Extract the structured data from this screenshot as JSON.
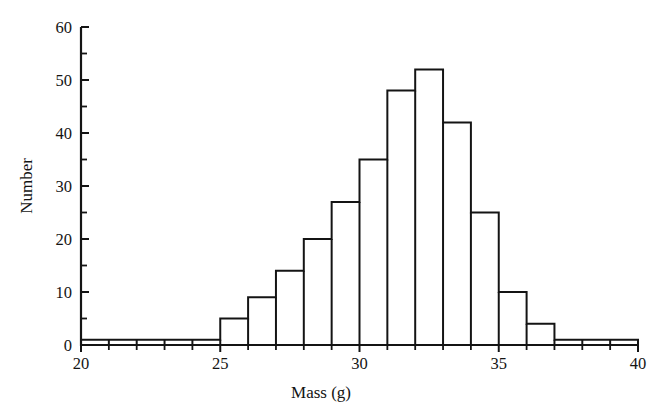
{
  "chart_data": {
    "type": "bar",
    "title": "",
    "subtitle": "",
    "xlabel": "Mass (g)",
    "ylabel": "Number",
    "xlim": [
      20,
      40
    ],
    "ylim": [
      0,
      60
    ],
    "grid": false,
    "legend": null,
    "bin_width": 1,
    "bin_edges": [
      20,
      21,
      22,
      23,
      24,
      25,
      26,
      27,
      28,
      29,
      30,
      31,
      32,
      33,
      34,
      35,
      36,
      37,
      38,
      39,
      40
    ],
    "categories": [
      "20-21",
      "21-22",
      "22-23",
      "23-24",
      "24-25",
      "25-26",
      "26-27",
      "27-28",
      "28-29",
      "29-30",
      "30-31",
      "31-32",
      "32-33",
      "33-34",
      "34-35",
      "35-36",
      "36-37",
      "37-38",
      "38-39",
      "39-40"
    ],
    "values": [
      1,
      1,
      1,
      1,
      1,
      5,
      9,
      14,
      20,
      27,
      35,
      48,
      52,
      42,
      25,
      10,
      4,
      1,
      1,
      1
    ],
    "x_ticks_major": [
      20,
      25,
      30,
      35,
      40
    ],
    "x_tick_labels": [
      "20",
      "25",
      "30",
      "35",
      "40"
    ],
    "x_ticks_minor": [
      21,
      22,
      23,
      24,
      26,
      27,
      28,
      29,
      31,
      32,
      33,
      34,
      36,
      37,
      38,
      39
    ],
    "y_ticks_major": [
      0,
      10,
      20,
      30,
      40,
      50,
      60
    ],
    "y_tick_labels": [
      "0",
      "10",
      "20",
      "30",
      "40",
      "50",
      "60"
    ],
    "y_ticks_minor": [
      5,
      15,
      25,
      35,
      45,
      55
    ],
    "colors": {
      "bar_fill": "#ffffff",
      "bar_stroke": "#141414",
      "axis": "#141414",
      "background": "#ffffff",
      "text": "#141414"
    }
  },
  "figure": {
    "caption": "",
    "annotations": []
  }
}
